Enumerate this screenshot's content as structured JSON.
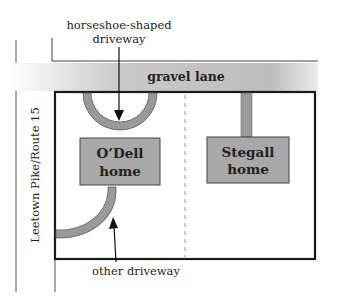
{
  "diagram": {
    "type": "property-map",
    "labels": {
      "horseshoe_driveway": [
        "horseshoe-shaped",
        "driveway"
      ],
      "gravel_lane": "gravel lane",
      "road": "Leetown Pike/Route 15",
      "odell_home": [
        "O’Dell",
        "home"
      ],
      "stegall_home": [
        "Stegall",
        "home"
      ],
      "other_driveway": "other driveway"
    },
    "colors": {
      "driveway_fill": "#9a9a9a",
      "home_fill": "#a8a8a8",
      "lane_gradient_start": "#ffffff",
      "lane_gradient_end": "#b8b8b8",
      "outline": "#1a1a1a",
      "divider": "#999999"
    }
  }
}
